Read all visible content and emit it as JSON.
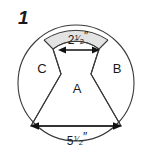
{
  "figure": {
    "number": "1",
    "shape_name": "circle-with-inscribed-regions",
    "colors": {
      "stroke": "#3a3a3a",
      "dimension_stroke": "#111111",
      "shaded_fill": "#e3e3e3",
      "background": "#ffffff",
      "text": "#1a1a1a"
    },
    "circle": {
      "center_x": 76,
      "center_y": 83,
      "radius": 58
    },
    "regions": [
      {
        "id": "A",
        "label": "A",
        "label_x": 77,
        "label_y": 93,
        "position": "center"
      },
      {
        "id": "B",
        "label": "B",
        "label_x": 117,
        "label_y": 73,
        "position": "right"
      },
      {
        "id": "C",
        "label": "C",
        "label_x": 42,
        "label_y": 73,
        "position": "left"
      }
    ],
    "dimensions": [
      {
        "id": "top-dimension",
        "whole": "2",
        "numerator": "1",
        "denominator": "2",
        "unit": "″",
        "text": "2½″",
        "label_x": 78,
        "label_y": 44,
        "line_y": 50,
        "line_x1": 59,
        "line_x2": 99
      },
      {
        "id": "bottom-dimension",
        "whole": "5",
        "numerator": "1",
        "denominator": "2",
        "unit": "″",
        "text": "5½″",
        "label_x": 77,
        "label_y": 145,
        "line_y": 126,
        "line_x1": 31,
        "line_x2": 121
      }
    ],
    "shaded_segments": [
      {
        "id": "shaded-left",
        "position": "top-left"
      },
      {
        "id": "shaded-right",
        "position": "top-right"
      }
    ]
  }
}
